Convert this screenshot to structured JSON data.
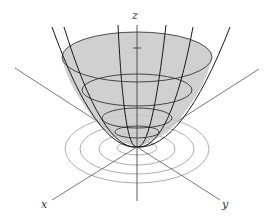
{
  "figure": {
    "axes": {
      "x_label": "x",
      "y_label": "y",
      "z_label": "z"
    },
    "colors": {
      "surface_fill": "#c8c8c8",
      "surface_lines": "#1a1a1a",
      "axis_lines": "#555555",
      "contour_lines": "#888888"
    },
    "level_curves_count": 4,
    "surface_cross_sections_count": 4,
    "meridian_count": 6
  }
}
